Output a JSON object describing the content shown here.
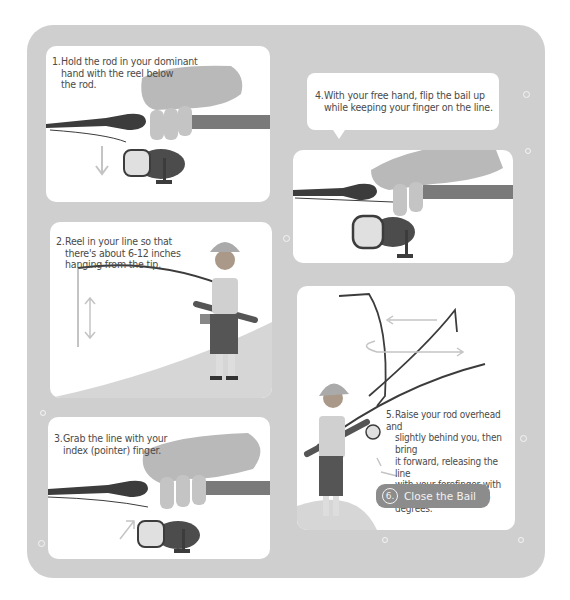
{
  "steps": [
    {
      "number": "1.",
      "text_lines": [
        "Hold the rod in your dominant",
        "hand with the reel below",
        "the rod."
      ]
    },
    {
      "number": "2.",
      "text_lines": [
        "Reel in your line so that",
        "there's about 6-12 inches",
        "hanging from the tip."
      ]
    },
    {
      "number": "3.",
      "text_lines": [
        "Grab the line with your",
        "index (pointer) finger."
      ]
    },
    {
      "number": "4.",
      "text_lines": [
        "With your free hand, flip the bail up",
        "while keeping your finger on the line."
      ]
    },
    {
      "number": "5.",
      "text_lines": [
        "Raise your rod overhead and",
        "slightly behind you, then bring",
        "it forward, releasing the line",
        "with your forefinger with",
        "your arm is around 45 degrees."
      ]
    },
    {
      "number": "6.",
      "text": "Close the Bail"
    }
  ],
  "colors": {
    "background": "#cfcfcf",
    "panel": "#ffffff",
    "hand": "#b9b9b9",
    "rod": "#6e6e6e",
    "dark": "#3c3c3c",
    "pill": "#8c8c8c"
  }
}
